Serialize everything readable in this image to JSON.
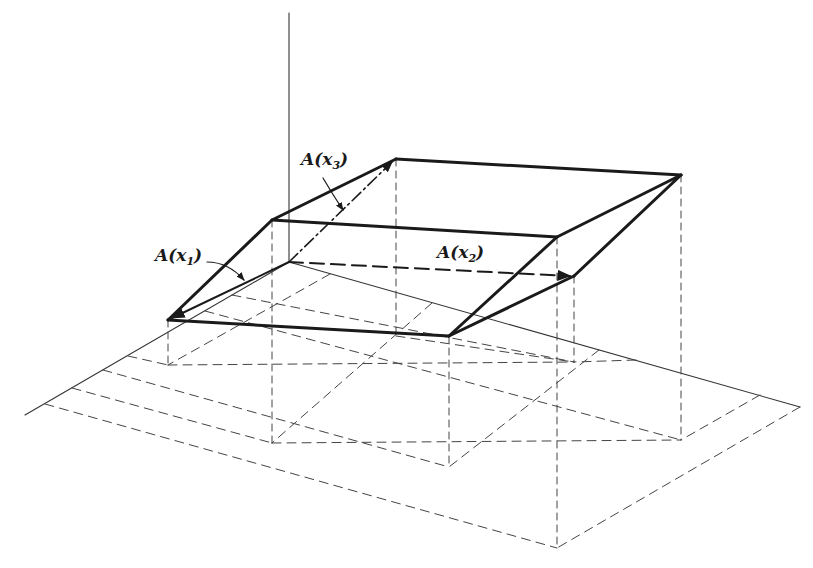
{
  "figure": {
    "type": "3d-wireframe-diagram",
    "colors": {
      "ink": "#1a1a1a",
      "thin": "#333333",
      "dashed": "#444444",
      "background": "#ffffff"
    }
  },
  "labels": {
    "a_x1": {
      "prefix": "A(x",
      "sub": "1",
      "suffix": ")"
    },
    "a_x2": {
      "prefix": "A(x",
      "sub": "2",
      "suffix": ")"
    },
    "a_x3": {
      "prefix": "A(x",
      "sub": "3",
      "suffix": ")"
    }
  },
  "geometry": {
    "origin": [
      289,
      262
    ],
    "axes": {
      "z": [
        [
          289,
          262
        ],
        [
          289,
          13
        ]
      ],
      "x": [
        [
          289,
          262
        ],
        [
          25,
          415
        ]
      ],
      "y": [
        [
          289,
          262
        ],
        [
          800,
          407
        ]
      ]
    },
    "vertices": {
      "P1": [
        168,
        320
      ],
      "P2": [
        272,
        220
      ],
      "P3": [
        396,
        159
      ],
      "P4": [
        681,
        175
      ],
      "P5": [
        557,
        237
      ],
      "P6": [
        449,
        336
      ],
      "P7": [
        574,
        276
      ]
    },
    "floor": {
      "P1": [
        168,
        365
      ],
      "P2": [
        272,
        443
      ],
      "P3": [
        396,
        336
      ],
      "P4": [
        681,
        440
      ],
      "P5": [
        557,
        548
      ],
      "P6": [
        449,
        467
      ],
      "P7": [
        574,
        362
      ]
    }
  }
}
